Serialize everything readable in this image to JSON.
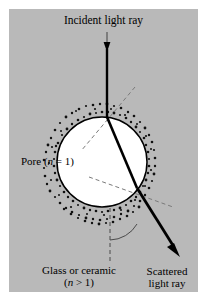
{
  "figure": {
    "panel_bg": "#b9b9b9",
    "page_bg": "#ffffff",
    "ink": "#000000",
    "pore_fill": "#ffffff",
    "dash_color": "#6b6b6b",
    "title_alt": "Light scattering at a pore in glass or ceramic"
  },
  "labels": {
    "incident": "Incident light ray",
    "pore_prefix": "Pore (",
    "pore_n": "n",
    "pore_suffix": " = 1)",
    "glass_line1": "Glass or ceramic",
    "glass_line2_prefix": "(",
    "glass_line2_n": "n",
    "glass_line2_suffix": " > 1)",
    "scattered_line1": "Scattered",
    "scattered_line2": "light ray"
  },
  "icons": {
    "incident_arrow": "down-arrow-icon",
    "scattered_arrow": "diagonal-arrow-icon",
    "normal_upper": "dashed-normal-icon",
    "normal_lower": "dashed-normal-icon",
    "vertical_reference": "dashed-vertical-icon",
    "angle_arc": "angle-arc-icon",
    "pore_circle": "pore-circle-icon",
    "speckle_band": "speckle-texture-icon"
  },
  "geometry": {
    "pore_center_x": 93,
    "pore_center_y": 153,
    "pore_radius": 45,
    "entry_point_x": 98,
    "entry_point_y": 108,
    "exit_point_x": 128,
    "exit_point_y": 179,
    "incident_start_y": 23,
    "scattered_end_x": 170,
    "scattered_end_y": 243
  }
}
